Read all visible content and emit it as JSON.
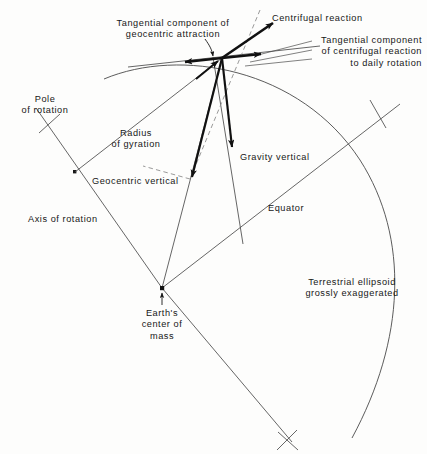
{
  "figure": {
    "background_color": "#fdfdfc",
    "line_color": "#4a4a4a",
    "vector_color": "#111111",
    "text_color": "#171717"
  },
  "labels": {
    "tangential_geocentric": "Tangential component of\ngeocentric attraction",
    "centrifugal_reaction": "Centrifugal reaction",
    "tangential_centrifugal": "Tangential component\nof centrifugal reaction\nto daily rotation",
    "pole_of_rotation": "Pole\nof rotation",
    "radius_of_gyration": "Radius\nof gyration",
    "geocentric_vertical": "Geocentric vertical",
    "gravity_vertical": "Gravity vertical",
    "equator": "Equator",
    "axis_of_rotation": "Axis of rotation",
    "earths_center_of_mass": "Earth's\ncenter of\nmass",
    "terrestrial_ellipsoid": "Terrestrial ellipsoid\ngrossly exaggerated"
  }
}
